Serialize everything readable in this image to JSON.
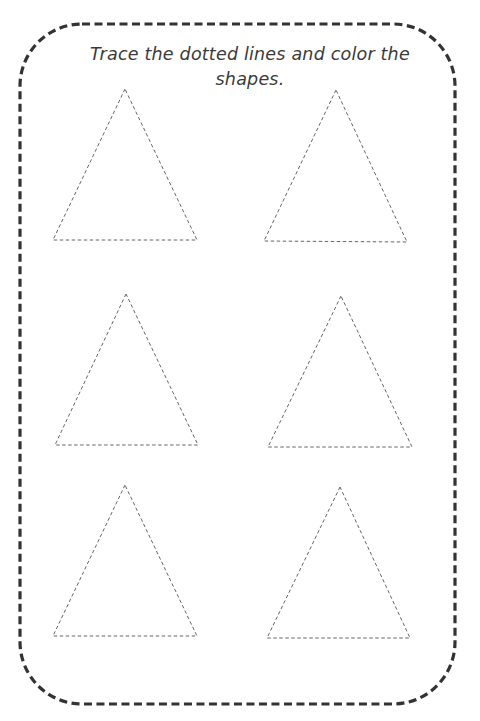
{
  "worksheet": {
    "instruction": "Trace the dotted lines and color the shapes.",
    "instruction_lines": [
      "Trace the dotted lines and color the",
      "shapes."
    ],
    "border": {
      "style": "dashed",
      "color": "#333333",
      "x": 20,
      "y": 24,
      "width": 435,
      "height": 680,
      "radius": 62
    },
    "shape_color": "#666666",
    "shapes": [
      {
        "type": "triangle",
        "points": "125,89 53,240 197,240"
      },
      {
        "type": "triangle",
        "points": "336,90 264,241 407,242"
      },
      {
        "type": "triangle",
        "points": "126,294 55,445 198,445"
      },
      {
        "type": "triangle",
        "points": "341,296 268,447 412,447"
      },
      {
        "type": "triangle",
        "points": "125,485 53,636 197,636"
      },
      {
        "type": "triangle",
        "points": "340,487 267,638 410,638"
      }
    ]
  }
}
